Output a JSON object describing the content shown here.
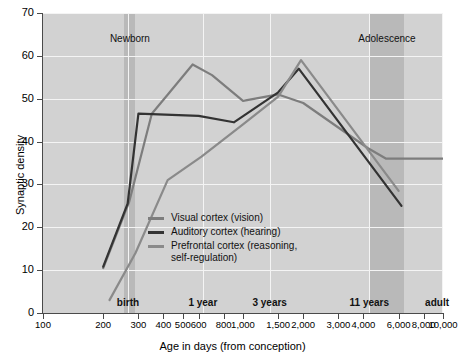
{
  "chart_data": {
    "type": "line",
    "title": "",
    "xlabel": "Age in days (from conception)",
    "ylabel": "Synaptic density",
    "xscale": "log",
    "xlim": [
      100,
      10000
    ],
    "ylim": [
      0,
      70
    ],
    "grid": true,
    "legend_position": "inside-center",
    "y_ticks": [
      0,
      10,
      20,
      30,
      40,
      50,
      60,
      70
    ],
    "x_ticks": [
      100,
      200,
      300,
      400,
      500,
      600,
      800,
      1000,
      1500,
      2000,
      3000,
      4000,
      6000,
      8000,
      10000
    ],
    "x_tick_labels": [
      "100",
      "200",
      "300",
      "400",
      "500",
      "600",
      "800",
      "1,000",
      "1,500",
      "2,000",
      "3,000",
      "4,000",
      "6,000",
      "8,000",
      "10,000"
    ],
    "stage_markers": [
      {
        "label": "birth",
        "x": 266
      },
      {
        "label": "1 year",
        "x": 630
      },
      {
        "label": "3 years",
        "x": 1360
      },
      {
        "label": "11 years",
        "x": 4280
      },
      {
        "label": "adult",
        "x": 10000
      }
    ],
    "shaded_bands": [
      {
        "label": "Newborn",
        "x_start": 255,
        "x_end": 290
      },
      {
        "label": "Adolescence",
        "x_start": 4300,
        "x_end": 6400
      }
    ],
    "series": [
      {
        "name": "Visual cortex (vision)",
        "color": "#7d7d7d",
        "points": [
          {
            "x": 200,
            "y": 10.5
          },
          {
            "x": 270,
            "y": 26.0
          },
          {
            "x": 350,
            "y": 46.5
          },
          {
            "x": 430,
            "y": 51.5
          },
          {
            "x": 560,
            "y": 58.0
          },
          {
            "x": 700,
            "y": 55.5
          },
          {
            "x": 1000,
            "y": 49.5
          },
          {
            "x": 1500,
            "y": 51.0
          },
          {
            "x": 2000,
            "y": 49.0
          },
          {
            "x": 4200,
            "y": 38.5
          },
          {
            "x": 5200,
            "y": 36.0
          },
          {
            "x": 10000,
            "y": 36.0
          }
        ]
      },
      {
        "name": "Auditory cortex (hearing)",
        "color": "#333333",
        "points": [
          {
            "x": 200,
            "y": 10.8
          },
          {
            "x": 265,
            "y": 25.5
          },
          {
            "x": 300,
            "y": 46.5
          },
          {
            "x": 600,
            "y": 46.0
          },
          {
            "x": 900,
            "y": 44.5
          },
          {
            "x": 1500,
            "y": 51.5
          },
          {
            "x": 1900,
            "y": 57.0
          },
          {
            "x": 6200,
            "y": 25.0
          }
        ]
      },
      {
        "name": "Prefrontal cortex (reasoning,\nself-regulation)",
        "color": "#8a8a8a",
        "points": [
          {
            "x": 215,
            "y": 3.0
          },
          {
            "x": 290,
            "y": 14.0
          },
          {
            "x": 420,
            "y": 31.0
          },
          {
            "x": 620,
            "y": 36.5
          },
          {
            "x": 1000,
            "y": 44.0
          },
          {
            "x": 1500,
            "y": 50.5
          },
          {
            "x": 1950,
            "y": 59.0
          },
          {
            "x": 6000,
            "y": 28.5
          }
        ]
      }
    ]
  },
  "legend": {
    "items": [
      {
        "label": "Visual cortex (vision)",
        "color": "#7d7d7d"
      },
      {
        "label": "Auditory cortex (hearing)",
        "color": "#333333"
      },
      {
        "label": "Prefrontal cortex (reasoning,\nself-regulation)",
        "color": "#8a8a8a"
      }
    ]
  }
}
